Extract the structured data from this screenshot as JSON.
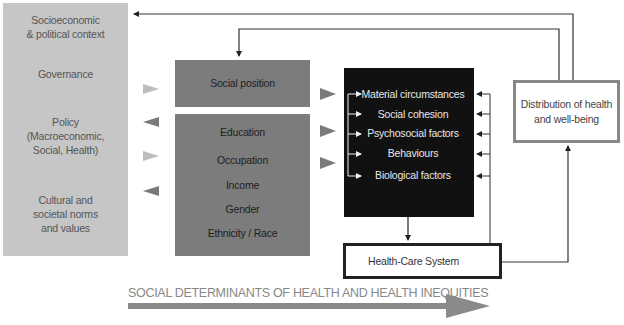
{
  "left_panel": {
    "items": [
      {
        "label_lines": [
          "Socioeconomic",
          "& political context"
        ]
      },
      {
        "label_lines": [
          "Governance"
        ]
      },
      {
        "label_lines": [
          "Policy",
          "(Macroeconomic,",
          "Social, Health)"
        ]
      },
      {
        "label_lines": [
          "Cultural and",
          "societal norms",
          "and values"
        ]
      }
    ]
  },
  "social_position": {
    "label": "Social position"
  },
  "structural_factors": {
    "items": [
      "Education",
      "Occupation",
      "Income",
      "Gender",
      "Ethnicity / Race"
    ]
  },
  "intermediary_determinants": {
    "items": [
      "Material circumstances",
      "Social cohesion",
      "Psychosocial factors",
      "Behaviours",
      "Biological factors"
    ]
  },
  "health_care_system": {
    "label": "Health-Care System"
  },
  "outcome": {
    "label_lines": [
      "Distribution of health",
      "and well-being"
    ]
  },
  "footer": {
    "label": "SOCIAL DETERMINANTS OF HEALTH AND HEALTH INEQUITIES"
  },
  "colors": {
    "left_panel": "#c6c6c6",
    "grey_box": "#7c7c7c",
    "black_box": "#111111",
    "arrow_light": "#bdbdbd",
    "arrow_dark": "#7a7a7a",
    "footer_text": "#888888"
  }
}
